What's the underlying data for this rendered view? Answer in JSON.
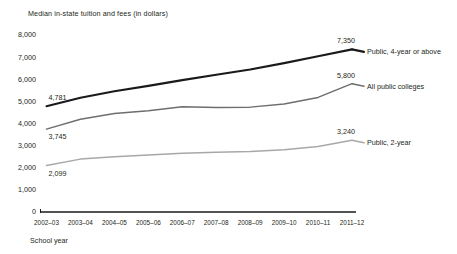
{
  "chart_data": {
    "type": "line",
    "title": "Median in-state tuition and fees (in dollars)",
    "xlabel": "School year",
    "ylabel": "",
    "ylim": [
      0,
      8000
    ],
    "ytick_values": [
      8000,
      7000,
      6000,
      5000,
      4000,
      3000,
      2000,
      1000,
      0
    ],
    "ytick_labels": [
      "8,000",
      "7,000",
      "6,000",
      "5,000",
      "4,000",
      "3,000",
      "2,000",
      "1,000",
      "0"
    ],
    "grid": false,
    "legend_position": "right-inline-labels",
    "categories": [
      "2002–03",
      "2003–04",
      "2004–05",
      "2005–06",
      "2006–07",
      "2007–08",
      "2008–09",
      "2009–10",
      "2010–11",
      "2011–12"
    ],
    "series": [
      {
        "name": "Public, 4-year or above",
        "color": "#1a1a1a",
        "width": 2.1,
        "start_label": "4,781",
        "end_label": "7,350",
        "values": [
          4781,
          5160,
          5460,
          5700,
          5960,
          6200,
          6440,
          6730,
          7040,
          7350
        ]
      },
      {
        "name": "All public colleges",
        "color": "#6e6e6e",
        "width": 1.5,
        "start_label": "3,745",
        "end_label": "5,800",
        "values": [
          3745,
          4190,
          4450,
          4580,
          4760,
          4720,
          4740,
          4880,
          5180,
          5800
        ]
      },
      {
        "name": "Public, 2-year",
        "color": "#a8a8a8",
        "width": 1.5,
        "start_label": "2,099",
        "end_label": "3,240",
        "values": [
          2099,
          2390,
          2500,
          2580,
          2660,
          2700,
          2730,
          2810,
          2960,
          3240
        ]
      }
    ]
  },
  "labels": {
    "title": "Median in-state tuition and fees (in dollars)",
    "x_axis_name": "School year"
  }
}
